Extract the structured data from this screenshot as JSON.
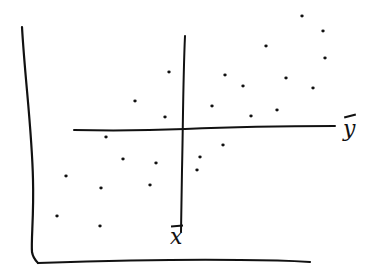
{
  "chart_data": {
    "type": "scatter",
    "title": "",
    "xlabel": "",
    "ylabel": "",
    "style": "hand-drawn sketch, black ink on white",
    "grid": false,
    "legend": null,
    "axes": {
      "x_axis": {
        "from_px": [
          33,
          264
        ],
        "to_px": [
          310,
          262
        ]
      },
      "y_axis": {
        "from_px": [
          22,
          27
        ],
        "to_px": [
          33,
          253
        ]
      }
    },
    "reference_lines": [
      {
        "name": "mean_x",
        "label": "x̄",
        "orientation": "vertical",
        "from_px": [
          185,
          36
        ],
        "to_px": [
          181,
          232
        ]
      },
      {
        "name": "mean_y",
        "label": "ȳ",
        "orientation": "horizontal",
        "from_px": [
          74,
          130
        ],
        "to_px": [
          335,
          126
        ]
      }
    ],
    "annotations": [
      "x̄",
      "ȳ"
    ],
    "points_px": [
      {
        "x": 302,
        "y": 16
      },
      {
        "x": 323,
        "y": 31
      },
      {
        "x": 266,
        "y": 46
      },
      {
        "x": 325,
        "y": 58
      },
      {
        "x": 169,
        "y": 72
      },
      {
        "x": 225,
        "y": 75
      },
      {
        "x": 286,
        "y": 78
      },
      {
        "x": 243,
        "y": 86
      },
      {
        "x": 313,
        "y": 88
      },
      {
        "x": 135,
        "y": 101
      },
      {
        "x": 212,
        "y": 106
      },
      {
        "x": 277,
        "y": 110
      },
      {
        "x": 251,
        "y": 116
      },
      {
        "x": 165,
        "y": 117
      },
      {
        "x": 106,
        "y": 137
      },
      {
        "x": 223,
        "y": 145
      },
      {
        "x": 200,
        "y": 157
      },
      {
        "x": 123,
        "y": 159
      },
      {
        "x": 156,
        "y": 163
      },
      {
        "x": 197,
        "y": 170
      },
      {
        "x": 66,
        "y": 176
      },
      {
        "x": 150,
        "y": 185
      },
      {
        "x": 101,
        "y": 188
      },
      {
        "x": 57,
        "y": 216
      },
      {
        "x": 100,
        "y": 226
      }
    ],
    "quadrant_counts": {
      "upper_right": 11,
      "upper_left": 3,
      "lower_left": 8,
      "lower_right": 3
    }
  },
  "labels": {
    "mean_x": "x",
    "mean_y": "y"
  }
}
